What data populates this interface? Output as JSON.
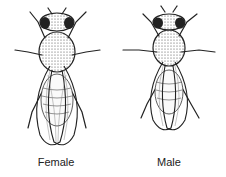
{
  "figure": {
    "flies": [
      {
        "label": "Female",
        "icon": "female-fly-icon"
      },
      {
        "label": "Male",
        "icon": "male-fly-icon"
      }
    ]
  }
}
